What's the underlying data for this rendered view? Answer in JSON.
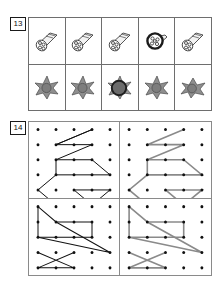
{
  "page": {
    "background": "#ffffff",
    "width": 224,
    "height": 286,
    "ink_dark": "#111111",
    "ink_gray": "#8a8a8a",
    "rule_color": "#6e6e6e"
  },
  "exercises": [
    {
      "number": "13",
      "type": "picture-comparison-table",
      "rows": [
        {
          "name": "bundle-row",
          "cells": [
            {
              "label": "bundle-side-view",
              "variant": "side",
              "highlighted": false
            },
            {
              "label": "bundle-side-view",
              "variant": "side",
              "highlighted": false
            },
            {
              "label": "bundle-side-view",
              "variant": "side",
              "highlighted": false
            },
            {
              "label": "bundle-front-view",
              "variant": "front",
              "highlighted": true
            },
            {
              "label": "bundle-side-view",
              "variant": "side",
              "highlighted": false
            }
          ]
        },
        {
          "name": "flower-row",
          "cells": [
            {
              "label": "flower-side-view",
              "variant": "side",
              "highlighted": false
            },
            {
              "label": "flower-side-view",
              "variant": "side",
              "highlighted": false
            },
            {
              "label": "flower-front-view",
              "variant": "front",
              "highlighted": true
            },
            {
              "label": "flower-side-view",
              "variant": "side",
              "highlighted": false
            },
            {
              "label": "flower-side-view",
              "variant": "side",
              "highlighted": false
            }
          ]
        }
      ]
    },
    {
      "number": "14",
      "type": "dot-grid-copy-task",
      "grid": {
        "columns": 5,
        "rows": 5,
        "dot_radius": 1.6
      },
      "panels": [
        {
          "name": "panel-top-left",
          "position": "top-left",
          "line_color": "#111111",
          "line_width": 1.0,
          "shape": "zigzag-arrow-figure",
          "polylines": [
            [
              [
                1,
                1
              ],
              [
                3,
                0
              ],
              [
                1,
                1
              ],
              [
                3,
                1
              ],
              [
                1,
                2
              ],
              [
                1,
                3
              ],
              [
                4,
                3
              ],
              [
                3,
                2
              ],
              [
                1,
                2
              ]
            ],
            [
              [
                1,
                3
              ],
              [
                0,
                4
              ],
              [
                1,
                5
              ]
            ],
            [
              [
                2,
                4
              ],
              [
                4,
                4
              ],
              [
                3,
                5
              ],
              [
                2,
                4
              ]
            ]
          ]
        },
        {
          "name": "panel-top-right",
          "position": "top-right",
          "line_color": "#8a8a8a",
          "line_width": 1.6,
          "shape": "zigzag-arrow-figure",
          "polylines": [
            [
              [
                1,
                1
              ],
              [
                3,
                0
              ],
              [
                1,
                1
              ],
              [
                3,
                1
              ],
              [
                1,
                2
              ],
              [
                1,
                3
              ],
              [
                4,
                3
              ],
              [
                3,
                2
              ],
              [
                1,
                2
              ]
            ],
            [
              [
                1,
                3
              ],
              [
                0,
                4
              ],
              [
                1,
                5
              ]
            ],
            [
              [
                2,
                4
              ],
              [
                4,
                4
              ],
              [
                3,
                5
              ],
              [
                2,
                4
              ]
            ]
          ]
        },
        {
          "name": "panel-bottom-left",
          "position": "bottom-left",
          "line_color": "#111111",
          "line_width": 1.0,
          "shape": "boat-star-figure",
          "polylines": [
            [
              [
                0,
                0
              ],
              [
                1,
                1
              ],
              [
                3,
                1
              ],
              [
                3,
                2
              ],
              [
                0,
                2
              ],
              [
                0,
                0
              ]
            ],
            [
              [
                0,
                2
              ],
              [
                4,
                3
              ],
              [
                1,
                1
              ]
            ],
            [
              [
                0,
                3
              ],
              [
                2,
                4
              ],
              [
                0,
                4
              ],
              [
                2,
                3
              ]
            ]
          ]
        },
        {
          "name": "panel-bottom-right",
          "position": "bottom-right",
          "line_color": "#8a8a8a",
          "line_width": 1.6,
          "shape": "boat-star-figure",
          "polylines": [
            [
              [
                0,
                0
              ],
              [
                1,
                1
              ],
              [
                3,
                1
              ],
              [
                3,
                2
              ],
              [
                0,
                2
              ],
              [
                0,
                0
              ]
            ],
            [
              [
                0,
                2
              ],
              [
                4,
                3
              ],
              [
                1,
                1
              ]
            ],
            [
              [
                0,
                3
              ],
              [
                2,
                4
              ],
              [
                0,
                4
              ],
              [
                2,
                3
              ]
            ]
          ]
        }
      ]
    }
  ]
}
